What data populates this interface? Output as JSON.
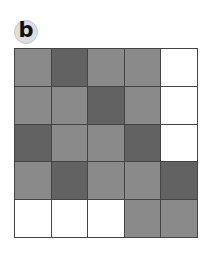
{
  "panel_label": "b",
  "colors": {
    "medium": "#8a8a8a",
    "dark": "#626262",
    "white": "#ffffff",
    "border": "#444444"
  },
  "grid": {
    "rows": 5,
    "cols": 5,
    "legend": {
      "m": "medium gray",
      "d": "dark gray",
      "w": "white"
    },
    "cells": [
      [
        "m",
        "d",
        "m",
        "m",
        "w"
      ],
      [
        "m",
        "m",
        "d",
        "m",
        "w"
      ],
      [
        "d",
        "m",
        "m",
        "d",
        "w"
      ],
      [
        "m",
        "d",
        "m",
        "m",
        "d"
      ],
      [
        "w",
        "w",
        "w",
        "m",
        "m"
      ]
    ]
  }
}
